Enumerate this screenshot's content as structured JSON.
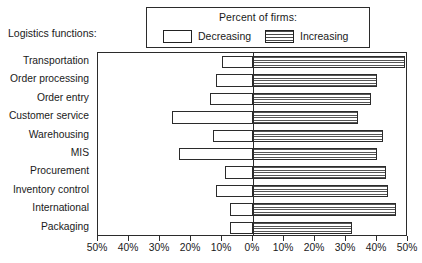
{
  "axis_group_title": "Logistics functions:",
  "legend": {
    "title": "Percent of firms:",
    "decreasing_label": "Decreasing",
    "increasing_label": "Increasing",
    "decreasing_swatch": "empty-white-box",
    "increasing_swatch": "horizontal-striped-box"
  },
  "chart_data": {
    "type": "bar",
    "orientation": "horizontal",
    "subtype": "diverging-paired-bar",
    "title": "",
    "subtitle": "",
    "xlabel": "",
    "ylabel": "Logistics functions:",
    "legend_title": "Percent of firms:",
    "legend_position": "top-center",
    "grid": false,
    "xlim": [
      -50,
      50
    ],
    "x_tick_values": [
      -50,
      -40,
      -30,
      -20,
      -10,
      0,
      10,
      20,
      30,
      40,
      50
    ],
    "x_tick_labels": [
      "50%",
      "40%",
      "30%",
      "20%",
      "10%",
      "0%",
      "10%",
      "20%",
      "30%",
      "40%",
      "50%"
    ],
    "categories": [
      "Transportation",
      "Order processing",
      "Order entry",
      "Customer service",
      "Warehousing",
      "MIS",
      "Procurement",
      "Inventory control",
      "International",
      "Packaging"
    ],
    "series": [
      {
        "name": "Decreasing",
        "direction": "left",
        "values": [
          10,
          12,
          14,
          26,
          13,
          24,
          9,
          12,
          7.5,
          7.5
        ]
      },
      {
        "name": "Increasing",
        "direction": "right",
        "values": [
          49,
          40,
          38,
          34,
          42,
          40,
          43,
          43.5,
          46,
          32
        ]
      }
    ]
  }
}
